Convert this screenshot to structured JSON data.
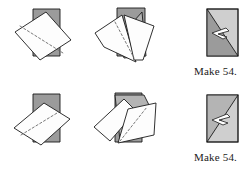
{
  "figure": {
    "type": "sewing-instruction-diagram",
    "background_color": "#ffffff",
    "colors": {
      "outline": "#1a1a1a",
      "fabric_light": "#fdfdfd",
      "fabric_gray_dark": "#9b9b9b",
      "fabric_gray_mid": "#b4b4b4",
      "fabric_gray_light": "#cfcfcf",
      "stitch_line": "#6a6a6a",
      "text": "#1a1a1a"
    }
  },
  "rows": [
    {
      "id": "row-1",
      "orientation": "diagonal-top-left-to-bottom-right",
      "steps": [
        {
          "name": "place-and-stitch",
          "label": "",
          "stitch_line": "dashed-diagonal"
        },
        {
          "name": "fold-open",
          "label": "",
          "stitch_line": "dashed-diagonal"
        },
        {
          "name": "finished-unit",
          "label": "",
          "arrow": "pressing-arrow"
        }
      ],
      "caption": "Make 54."
    },
    {
      "id": "row-2",
      "orientation": "diagonal-bottom-left-to-top-right",
      "steps": [
        {
          "name": "place-and-stitch",
          "label": "",
          "stitch_line": "dashed-diagonal"
        },
        {
          "name": "fold-open",
          "label": "",
          "stitch_line": "dashed-diagonal"
        },
        {
          "name": "finished-unit",
          "label": "",
          "arrow": "pressing-arrow"
        }
      ],
      "caption": "Make 54."
    }
  ]
}
